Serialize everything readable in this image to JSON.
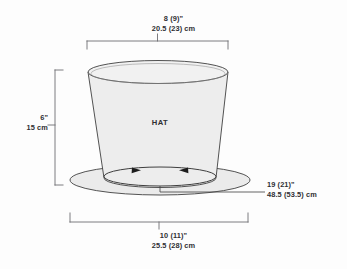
{
  "diagram": {
    "title": "HAT",
    "body_label": "HAT",
    "colors": {
      "background": "#fdfdfd",
      "fill": "#ededed",
      "brim_fill": "#e9e9e9",
      "outline": "#3a3a3a",
      "bracket": "#6d6d72",
      "text": "#2f2f33"
    },
    "dimensions": {
      "top": {
        "name": "crown-top-width",
        "inches": "8 (9)\"",
        "metric": "20.5 (23) cm"
      },
      "left": {
        "name": "crown-height",
        "inches": "6\"",
        "metric": "15 cm"
      },
      "right": {
        "name": "brim-circumference",
        "inches": "19 (21)\"",
        "metric": "48.5 (53.5) cm"
      },
      "bottom": {
        "name": "brim-width",
        "inches": "10 (11)\"",
        "metric": "25.5 (28) cm"
      }
    }
  }
}
